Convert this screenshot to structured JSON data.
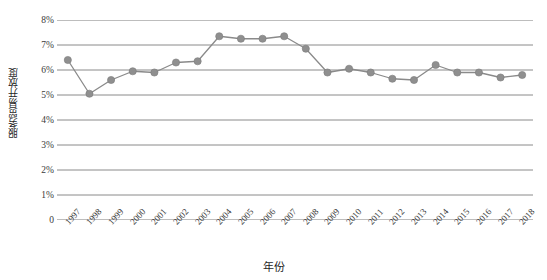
{
  "chart_data": {
    "type": "line",
    "title": "",
    "xlabel": "年份",
    "ylabel": "服务贸易开放度",
    "x": [
      1997,
      1998,
      1999,
      2000,
      2001,
      2002,
      2003,
      2004,
      2005,
      2006,
      2007,
      2008,
      2009,
      2010,
      2011,
      2012,
      2013,
      2014,
      2015,
      2016,
      2017,
      2018
    ],
    "categories": [
      "1997",
      "1998",
      "1999",
      "2000",
      "2001",
      "2002",
      "2003",
      "2004",
      "2005",
      "2006",
      "2007",
      "2008",
      "2009",
      "2010",
      "2011",
      "2012",
      "2013",
      "2014",
      "2015",
      "2016",
      "2017",
      "2018"
    ],
    "values": [
      6.4,
      5.05,
      5.6,
      5.95,
      5.9,
      6.3,
      6.35,
      7.35,
      7.25,
      7.25,
      7.35,
      6.85,
      5.9,
      6.05,
      5.9,
      5.65,
      5.6,
      6.2,
      5.9,
      5.9,
      5.7,
      5.8
    ],
    "series": [
      {
        "name": "服务贸易开放度",
        "values": [
          6.4,
          5.05,
          5.6,
          5.95,
          5.9,
          6.3,
          6.35,
          7.35,
          7.25,
          7.25,
          7.35,
          6.85,
          5.9,
          6.05,
          5.9,
          5.65,
          5.6,
          6.2,
          5.9,
          5.9,
          5.7,
          5.8
        ]
      }
    ],
    "ylim": [
      0,
      8
    ],
    "ytick_labels": [
      "8%",
      "7%",
      "6%",
      "5%",
      "4%",
      "3%",
      "2%",
      "1%",
      "0"
    ],
    "ytick_values": [
      8,
      7,
      6,
      5,
      4,
      3,
      2,
      1,
      0
    ],
    "grid": true,
    "legend": "none",
    "unit": "%",
    "line_color": "#8a8a8a",
    "marker_color": "#8f8f8f",
    "grid_color": "#7d7d7d",
    "text_color": "#2b2b2b"
  }
}
